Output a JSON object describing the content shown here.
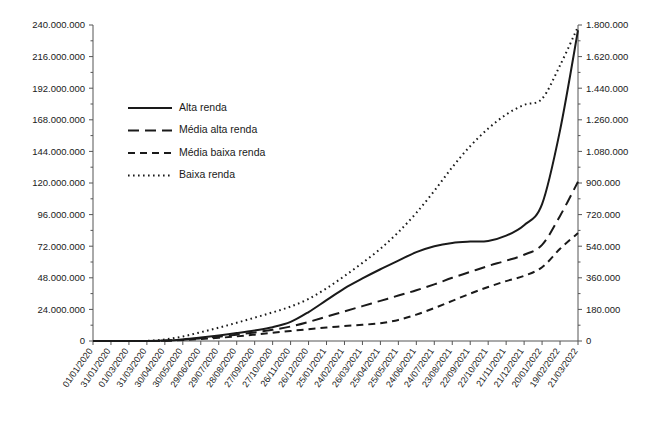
{
  "chart_data": {
    "type": "line",
    "title": "",
    "subtitle": "",
    "xlabel": "",
    "ylabel": "",
    "grid": false,
    "legend_position": "upper-left-inside",
    "x_axis": {
      "type": "category-date",
      "tick_labels": [
        "01/01/2020",
        "31/01/2020",
        "01/03/2020",
        "31/03/2020",
        "30/04/2020",
        "30/05/2020",
        "29/06/2020",
        "29/07/2020",
        "28/08/2020",
        "27/09/2020",
        "27/10/2020",
        "26/11/2020",
        "26/12/2020",
        "25/01/2021",
        "24/02/2021",
        "26/03/2021",
        "25/04/2021",
        "25/05/2021",
        "24/06/2021",
        "24/07/2021",
        "23/08/2021",
        "22/09/2021",
        "22/10/2021",
        "21/11/2021",
        "21/12/2021",
        "20/01/2022",
        "19/02/2022",
        "21/03/2022"
      ],
      "label_rotation_deg": -55
    },
    "y_axis_left": {
      "min": 0,
      "max": 240000000,
      "step": 24000000,
      "minor_ticks_per_step": 2,
      "tick_labels": [
        "0",
        "24.000.000",
        "48.000.000",
        "72.000.000",
        "96.000.000",
        "120.000.000",
        "144.000.000",
        "168.000.000",
        "192.000.000",
        "216.000.000",
        "240.000.000"
      ],
      "tick_values": [
        0,
        24000000,
        48000000,
        72000000,
        96000000,
        120000000,
        144000000,
        168000000,
        192000000,
        216000000,
        240000000
      ]
    },
    "y_axis_right": {
      "min": 0,
      "max": 1800000,
      "step": 180000,
      "minor_ticks_per_step": 2,
      "tick_labels": [
        "0",
        "180.000",
        "360.000",
        "540.000",
        "720.000",
        "900.000",
        "1.080.000",
        "1.260.000",
        "1.440.000",
        "1.620.000",
        "1.800.000"
      ],
      "tick_values": [
        0,
        180000,
        360000,
        540000,
        720000,
        900000,
        1080000,
        1260000,
        1440000,
        1620000,
        1800000
      ]
    },
    "series": [
      {
        "name": "Alta renda",
        "axis": "left",
        "dash": "solid",
        "stroke_width": 2.0,
        "values": [
          0,
          0,
          0,
          0,
          300000,
          1200000,
          2600000,
          4200000,
          6000000,
          8000000,
          10500000,
          14500000,
          22000000,
          31000000,
          40000000,
          47500000,
          54500000,
          61000000,
          67500000,
          72000000,
          74500000,
          75500000,
          76000000,
          80000000,
          88000000,
          104000000,
          160000000,
          236000000
        ]
      },
      {
        "name": "Média alta renda",
        "axis": "left",
        "dash": "long-dash",
        "stroke_width": 2.0,
        "values": [
          0,
          0,
          0,
          0,
          200000,
          900000,
          2000000,
          3300000,
          4800000,
          6500000,
          8500000,
          11000000,
          14500000,
          18500000,
          22500000,
          26500000,
          30500000,
          34500000,
          38500000,
          43000000,
          48000000,
          52500000,
          57000000,
          61000000,
          65500000,
          73000000,
          95000000,
          121000000
        ]
      },
      {
        "name": "Média baixa renda",
        "axis": "left",
        "dash": "medium-dash",
        "stroke_width": 2.0,
        "values": [
          0,
          0,
          0,
          0,
          150000,
          700000,
          1500000,
          2400000,
          3500000,
          4800000,
          6200000,
          7600000,
          9000000,
          10200000,
          11300000,
          12300000,
          13500000,
          16000000,
          20000000,
          25000000,
          30500000,
          36000000,
          41000000,
          45500000,
          49500000,
          56000000,
          70000000,
          82000000
        ]
      },
      {
        "name": "Baixa renda",
        "axis": "right",
        "dash": "dotted",
        "stroke_width": 2.0,
        "values": [
          0,
          0,
          0,
          1000,
          9000,
          26000,
          50000,
          76000,
          104000,
          133000,
          163000,
          196000,
          240000,
          300000,
          370000,
          445000,
          525000,
          620000,
          730000,
          855000,
          990000,
          1110000,
          1210000,
          1290000,
          1345000,
          1380000,
          1570000,
          1790000
        ]
      }
    ]
  },
  "legend": {
    "items": [
      {
        "label": "Alta renda",
        "dash": "solid"
      },
      {
        "label": "Média alta renda",
        "dash": "long-dash"
      },
      {
        "label": "Média baixa renda",
        "dash": "medium-dash"
      },
      {
        "label": "Baixa renda",
        "dash": "dotted"
      }
    ]
  },
  "colors": {
    "line": "#1a1a1a",
    "axis": "#555555",
    "background": "#ffffff",
    "text": "#1a1a1a"
  }
}
